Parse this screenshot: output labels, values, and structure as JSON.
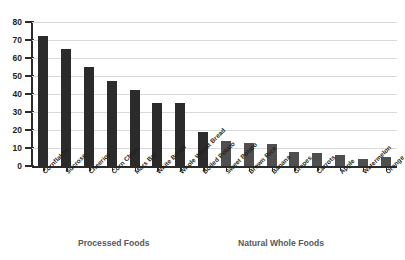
{
  "chart_data": {
    "type": "bar",
    "title": "",
    "xlabel": "",
    "ylabel": "",
    "ylim": [
      0,
      80
    ],
    "yticks": [
      0,
      10,
      20,
      30,
      40,
      50,
      60,
      70,
      80
    ],
    "grid": true,
    "legend_position": "none",
    "categories": [
      "Cornflakes",
      "Sucrose",
      "Cheerios",
      "Corn Chips",
      "Mars Bar",
      "White Bread",
      "Whole Wheat Bread",
      "Boiled Potato",
      "Sweet Potato",
      "Brown Rice",
      "Banana",
      "Grapes",
      "Carrots",
      "Apple",
      "Watermelon",
      "Orange"
    ],
    "values": [
      72,
      65,
      55,
      47,
      42,
      35,
      35,
      19,
      14,
      13,
      12,
      8,
      7,
      6,
      4,
      5
    ],
    "groups": [
      {
        "label": "Processed Foods",
        "color": "#2b2b2b",
        "indices": [
          0,
          1,
          2,
          3,
          4,
          5,
          6,
          7
        ]
      },
      {
        "label": "Natural Whole Foods",
        "color": "#4f4f4f",
        "indices": [
          8,
          9,
          10,
          11,
          12,
          13,
          14,
          15
        ]
      }
    ]
  },
  "colors": {
    "background": "#ffffff",
    "gridline": "#d9d9d9",
    "axis": "#2b2b2b",
    "tick_text": "#231f20",
    "group_caption": "#58595b",
    "bar_processed": "#2b2b2b",
    "bar_natural": "#4f4f4f"
  },
  "captions": {
    "processed": "Processed Foods",
    "natural": "Natural Whole Foods"
  }
}
